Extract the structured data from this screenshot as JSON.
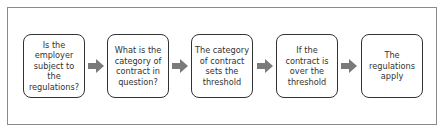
{
  "diagram": {
    "type": "flowchart",
    "steps": [
      {
        "label": "Is the employer subject to the regulations?"
      },
      {
        "label": "What is the category of contract in question?"
      },
      {
        "label": "The category of contract sets the threshold"
      },
      {
        "label": "If the contract is over the threshold"
      },
      {
        "label": "The regulations apply"
      }
    ],
    "arrow_color": "#7a7a7a",
    "border_color": "#333333"
  }
}
